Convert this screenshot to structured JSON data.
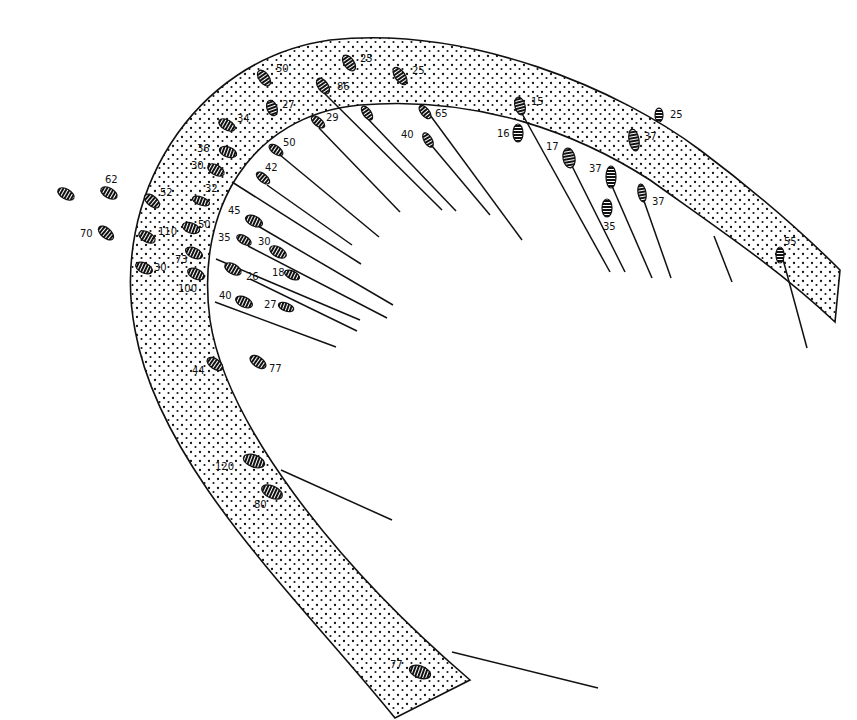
{
  "figure": {
    "colors": {
      "ink": "#111111",
      "paper": "#ffffff",
      "hatch": "#ffffff"
    }
  },
  "cells": [
    {
      "x": 264,
      "y": 78,
      "rx": 5,
      "ry": 9,
      "rot": -35,
      "label": "50",
      "lx": 276,
      "ly": 72
    },
    {
      "x": 349,
      "y": 63,
      "rx": 5,
      "ry": 9,
      "rot": -35,
      "label": "25",
      "lx": 360,
      "ly": 62
    },
    {
      "x": 400,
      "y": 76,
      "rx": 5,
      "ry": 10,
      "rot": -35,
      "label": "25",
      "lx": 412,
      "ly": 74
    },
    {
      "x": 323,
      "y": 86,
      "rx": 5,
      "ry": 9,
      "rot": -35,
      "label": "86",
      "lx": 337,
      "ly": 90
    },
    {
      "x": 272,
      "y": 108,
      "rx": 5,
      "ry": 8,
      "rot": -20,
      "label": "27",
      "lx": 282,
      "ly": 108
    },
    {
      "x": 227,
      "y": 125,
      "rx": 5,
      "ry": 9,
      "rot": -60,
      "label": "34",
      "lx": 237,
      "ly": 122
    },
    {
      "x": 318,
      "y": 122,
      "rx": 4,
      "ry": 8,
      "rot": -50,
      "label": "29",
      "lx": 326,
      "ly": 121
    },
    {
      "x": 367,
      "y": 113,
      "rx": 4,
      "ry": 8,
      "rot": -35,
      "label": "",
      "lx": 0,
      "ly": 0
    },
    {
      "x": 425,
      "y": 112,
      "rx": 4,
      "ry": 8,
      "rot": -40,
      "label": "65",
      "lx": 435,
      "ly": 117
    },
    {
      "x": 428,
      "y": 140,
      "rx": 4,
      "ry": 8,
      "rot": -30,
      "label": "40",
      "lx": 401,
      "ly": 138
    },
    {
      "x": 520,
      "y": 106,
      "rx": 5,
      "ry": 9,
      "rot": -15,
      "label": "15",
      "lx": 531,
      "ly": 105
    },
    {
      "x": 518,
      "y": 133,
      "rx": 5,
      "ry": 9,
      "rot": 0,
      "label": "16",
      "lx": 497,
      "ly": 137
    },
    {
      "x": 659,
      "y": 115,
      "rx": 4,
      "ry": 7,
      "rot": 0,
      "label": "25",
      "lx": 670,
      "ly": 118
    },
    {
      "x": 634,
      "y": 140,
      "rx": 5,
      "ry": 11,
      "rot": -10,
      "label": "37",
      "lx": 644,
      "ly": 140
    },
    {
      "x": 569,
      "y": 158,
      "rx": 6,
      "ry": 10,
      "rot": -10,
      "label": "17",
      "lx": 546,
      "ly": 150
    },
    {
      "x": 611,
      "y": 177,
      "rx": 5,
      "ry": 11,
      "rot": 0,
      "label": "37",
      "lx": 589,
      "ly": 172
    },
    {
      "x": 642,
      "y": 193,
      "rx": 4,
      "ry": 9,
      "rot": -10,
      "label": "37",
      "lx": 652,
      "ly": 205
    },
    {
      "x": 607,
      "y": 208,
      "rx": 5,
      "ry": 9,
      "rot": 0,
      "label": "35",
      "lx": 603,
      "ly": 230
    },
    {
      "x": 228,
      "y": 152,
      "rx": 5,
      "ry": 9,
      "rot": -70,
      "label": "36",
      "lx": 197,
      "ly": 152
    },
    {
      "x": 216,
      "y": 170,
      "rx": 5,
      "ry": 9,
      "rot": -60,
      "label": "30",
      "lx": 191,
      "ly": 169
    },
    {
      "x": 276,
      "y": 150,
      "rx": 4,
      "ry": 8,
      "rot": -55,
      "label": "50",
      "lx": 283,
      "ly": 146
    },
    {
      "x": 263,
      "y": 178,
      "rx": 4,
      "ry": 8,
      "rot": -50,
      "label": "42",
      "lx": 265,
      "ly": 171
    },
    {
      "x": 201,
      "y": 201,
      "rx": 4,
      "ry": 9,
      "rot": -70,
      "label": "32",
      "lx": 205,
      "ly": 192
    },
    {
      "x": 66,
      "y": 194,
      "rx": 5,
      "ry": 9,
      "rot": -60,
      "label": "",
      "lx": 0,
      "ly": 0
    },
    {
      "x": 109,
      "y": 193,
      "rx": 5,
      "ry": 9,
      "rot": -60,
      "label": "62",
      "lx": 105,
      "ly": 183
    },
    {
      "x": 152,
      "y": 201,
      "rx": 5,
      "ry": 9,
      "rot": -50,
      "label": "52",
      "lx": 160,
      "ly": 196
    },
    {
      "x": 106,
      "y": 233,
      "rx": 5,
      "ry": 9,
      "rot": -50,
      "label": "70",
      "lx": 80,
      "ly": 237
    },
    {
      "x": 147,
      "y": 237,
      "rx": 5,
      "ry": 9,
      "rot": -60,
      "label": "110",
      "lx": 158,
      "ly": 235
    },
    {
      "x": 191,
      "y": 228,
      "rx": 5,
      "ry": 9,
      "rot": -70,
      "label": "50",
      "lx": 198,
      "ly": 228
    },
    {
      "x": 254,
      "y": 221,
      "rx": 5,
      "ry": 9,
      "rot": -65,
      "label": "45",
      "lx": 228,
      "ly": 214
    },
    {
      "x": 244,
      "y": 240,
      "rx": 4,
      "ry": 8,
      "rot": -60,
      "label": "35",
      "lx": 218,
      "ly": 241
    },
    {
      "x": 278,
      "y": 252,
      "rx": 5,
      "ry": 9,
      "rot": -60,
      "label": "30",
      "lx": 258,
      "ly": 245
    },
    {
      "x": 194,
      "y": 253,
      "rx": 5,
      "ry": 9,
      "rot": -65,
      "label": "73",
      "lx": 175,
      "ly": 263
    },
    {
      "x": 144,
      "y": 268,
      "rx": 5,
      "ry": 9,
      "rot": -65,
      "label": "30",
      "lx": 154,
      "ly": 271
    },
    {
      "x": 196,
      "y": 274,
      "rx": 5,
      "ry": 9,
      "rot": -65,
      "label": "100",
      "lx": 178,
      "ly": 292
    },
    {
      "x": 233,
      "y": 269,
      "rx": 5,
      "ry": 9,
      "rot": -60,
      "label": "26",
      "lx": 246,
      "ly": 280
    },
    {
      "x": 292,
      "y": 275,
      "rx": 4,
      "ry": 8,
      "rot": -65,
      "label": "18",
      "lx": 272,
      "ly": 276
    },
    {
      "x": 244,
      "y": 302,
      "rx": 5,
      "ry": 9,
      "rot": -65,
      "label": "40",
      "lx": 219,
      "ly": 299
    },
    {
      "x": 286,
      "y": 307,
      "rx": 4,
      "ry": 8,
      "rot": -70,
      "label": "27",
      "lx": 264,
      "ly": 308
    },
    {
      "x": 215,
      "y": 364,
      "rx": 5,
      "ry": 9,
      "rot": -55,
      "label": "44",
      "lx": 192,
      "ly": 374
    },
    {
      "x": 258,
      "y": 362,
      "rx": 5,
      "ry": 9,
      "rot": -55,
      "label": "77",
      "lx": 269,
      "ly": 372
    },
    {
      "x": 254,
      "y": 461,
      "rx": 6,
      "ry": 11,
      "rot": -70,
      "label": "120",
      "lx": 215,
      "ly": 470
    },
    {
      "x": 272,
      "y": 492,
      "rx": 6,
      "ry": 11,
      "rot": -65,
      "label": "80",
      "lx": 254,
      "ly": 508
    },
    {
      "x": 420,
      "y": 672,
      "rx": 6,
      "ry": 11,
      "rot": -70,
      "label": "77",
      "lx": 390,
      "ly": 668
    },
    {
      "x": 780,
      "y": 255,
      "rx": 4,
      "ry": 8,
      "rot": 0,
      "label": "55",
      "lx": 784,
      "ly": 245
    }
  ],
  "rays": [
    {
      "x1": 324,
      "y1": 93,
      "x2": 442,
      "y2": 210
    },
    {
      "x1": 368,
      "y1": 119,
      "x2": 456,
      "y2": 211
    },
    {
      "x1": 430,
      "y1": 115,
      "x2": 522,
      "y2": 240
    },
    {
      "x1": 432,
      "y1": 146,
      "x2": 490,
      "y2": 215
    },
    {
      "x1": 319,
      "y1": 128,
      "x2": 400,
      "y2": 212
    },
    {
      "x1": 280,
      "y1": 155,
      "x2": 379,
      "y2": 237
    },
    {
      "x1": 267,
      "y1": 185,
      "x2": 352,
      "y2": 245
    },
    {
      "x1": 232,
      "y1": 182,
      "x2": 361,
      "y2": 264
    },
    {
      "x1": 258,
      "y1": 226,
      "x2": 393,
      "y2": 305
    },
    {
      "x1": 248,
      "y1": 246,
      "x2": 387,
      "y2": 318
    },
    {
      "x1": 216,
      "y1": 259,
      "x2": 360,
      "y2": 320
    },
    {
      "x1": 250,
      "y1": 279,
      "x2": 357,
      "y2": 331
    },
    {
      "x1": 215,
      "y1": 302,
      "x2": 336,
      "y2": 347
    },
    {
      "x1": 520,
      "y1": 110,
      "x2": 610,
      "y2": 272
    },
    {
      "x1": 572,
      "y1": 166,
      "x2": 625,
      "y2": 272
    },
    {
      "x1": 612,
      "y1": 186,
      "x2": 652,
      "y2": 278
    },
    {
      "x1": 644,
      "y1": 201,
      "x2": 671,
      "y2": 278
    },
    {
      "x1": 714,
      "y1": 236,
      "x2": 732,
      "y2": 282
    },
    {
      "x1": 781,
      "y1": 252,
      "x2": 807,
      "y2": 348
    },
    {
      "x1": 281,
      "y1": 470,
      "x2": 392,
      "y2": 520
    },
    {
      "x1": 452,
      "y1": 652,
      "x2": 598,
      "y2": 688
    }
  ]
}
